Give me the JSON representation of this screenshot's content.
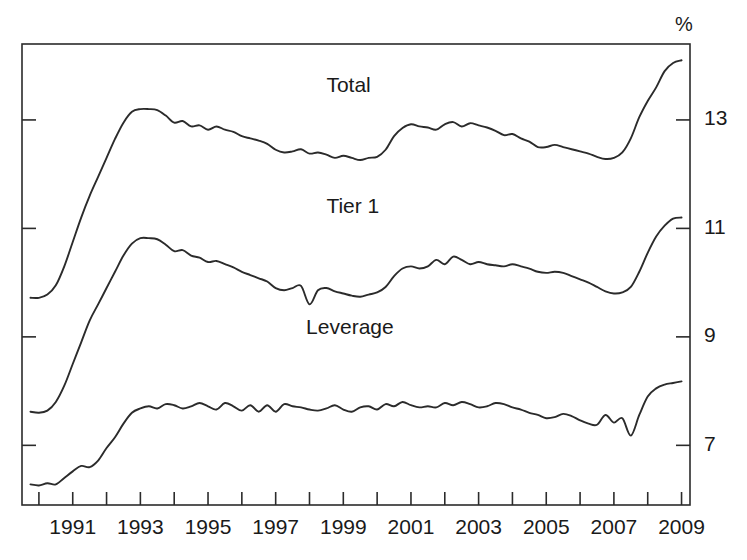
{
  "chart_data": {
    "type": "line",
    "title": "",
    "subtitle": "",
    "xlabel": "",
    "ylabel": "",
    "unit_label": "%",
    "grid": false,
    "legend_position": "inline-labels",
    "xlim": [
      1990.0,
      2009.75
    ],
    "ylim": [
      5.9,
      14.4
    ],
    "x_tick_years": [
      1990,
      1991,
      1992,
      1993,
      1994,
      1995,
      1996,
      1997,
      1998,
      1999,
      2000,
      2001,
      2002,
      2003,
      2004,
      2005,
      2006,
      2007,
      2008,
      2009
    ],
    "x_tick_labels": [
      "",
      "1991",
      "",
      "1993",
      "",
      "1995",
      "",
      "1997",
      "",
      "1999",
      "",
      "2001",
      "",
      "2003",
      "",
      "2005",
      "",
      "2007",
      "",
      "2009"
    ],
    "x_labeled_years": [
      1991,
      1993,
      1995,
      1997,
      1999,
      2001,
      2003,
      2005,
      2007,
      2009
    ],
    "y_ticks": [
      7,
      9,
      11,
      13
    ],
    "y_tick_labels": [
      "7",
      "9",
      "11",
      "13"
    ],
    "y_axis_side": "right",
    "series": [
      {
        "name": "Total",
        "label": "Total",
        "color": "#2b2b2b",
        "label_x": 1999.0,
        "label_y": 13.62,
        "x": [
          1990.25,
          1990.5,
          1990.75,
          1991.0,
          1991.25,
          1991.5,
          1991.75,
          1992.0,
          1992.25,
          1992.5,
          1992.75,
          1993.0,
          1993.25,
          1993.5,
          1993.75,
          1994.0,
          1994.25,
          1994.5,
          1994.75,
          1995.0,
          1995.25,
          1995.5,
          1995.75,
          1996.0,
          1996.25,
          1996.5,
          1996.75,
          1997.0,
          1997.25,
          1997.5,
          1997.75,
          1998.0,
          1998.25,
          1998.5,
          1998.75,
          1999.0,
          1999.25,
          1999.5,
          1999.75,
          2000.0,
          2000.25,
          2000.5,
          2000.75,
          2001.0,
          2001.25,
          2001.5,
          2001.75,
          2002.0,
          2002.25,
          2002.5,
          2002.75,
          2003.0,
          2003.25,
          2003.5,
          2003.75,
          2004.0,
          2004.25,
          2004.5,
          2004.75,
          2005.0,
          2005.25,
          2005.5,
          2005.75,
          2006.0,
          2006.25,
          2006.5,
          2006.75,
          2007.0,
          2007.25,
          2007.5,
          2007.75,
          2008.0,
          2008.25,
          2008.5,
          2008.75,
          2009.0,
          2009.25,
          2009.5
        ],
        "y": [
          9.72,
          9.72,
          9.78,
          9.95,
          10.3,
          10.75,
          11.2,
          11.6,
          11.95,
          12.3,
          12.65,
          12.95,
          13.15,
          13.2,
          13.2,
          13.18,
          13.08,
          12.95,
          12.98,
          12.88,
          12.9,
          12.82,
          12.88,
          12.82,
          12.78,
          12.7,
          12.66,
          12.62,
          12.56,
          12.45,
          12.4,
          12.42,
          12.46,
          12.38,
          12.4,
          12.36,
          12.3,
          12.34,
          12.3,
          12.26,
          12.3,
          12.32,
          12.45,
          12.7,
          12.85,
          12.92,
          12.88,
          12.86,
          12.82,
          12.92,
          12.96,
          12.88,
          12.94,
          12.9,
          12.86,
          12.8,
          12.72,
          12.74,
          12.66,
          12.6,
          12.5,
          12.5,
          12.54,
          12.5,
          12.46,
          12.42,
          12.38,
          12.32,
          12.28,
          12.3,
          12.4,
          12.66,
          13.05,
          13.35,
          13.6,
          13.9,
          14.05,
          14.1
        ]
      },
      {
        "name": "Tier 1",
        "label": "Tier 1",
        "color": "#2b2b2b",
        "label_x": 1999.0,
        "label_y": 11.38,
        "x": [
          1990.25,
          1990.5,
          1990.75,
          1991.0,
          1991.25,
          1991.5,
          1991.75,
          1992.0,
          1992.25,
          1992.5,
          1992.75,
          1993.0,
          1993.25,
          1993.5,
          1993.75,
          1994.0,
          1994.25,
          1994.5,
          1994.75,
          1995.0,
          1995.25,
          1995.5,
          1995.75,
          1996.0,
          1996.25,
          1996.5,
          1996.75,
          1997.0,
          1997.25,
          1997.5,
          1997.75,
          1998.0,
          1998.25,
          1998.5,
          1998.75,
          1999.0,
          1999.25,
          1999.5,
          1999.75,
          2000.0,
          2000.25,
          2000.5,
          2000.75,
          2001.0,
          2001.25,
          2001.5,
          2001.75,
          2002.0,
          2002.25,
          2002.5,
          2002.75,
          2003.0,
          2003.25,
          2003.5,
          2003.75,
          2004.0,
          2004.25,
          2004.5,
          2004.75,
          2005.0,
          2005.25,
          2005.5,
          2005.75,
          2006.0,
          2006.25,
          2006.5,
          2006.75,
          2007.0,
          2007.25,
          2007.5,
          2007.75,
          2008.0,
          2008.25,
          2008.5,
          2008.75,
          2009.0,
          2009.25,
          2009.5
        ],
        "y": [
          7.62,
          7.6,
          7.64,
          7.8,
          8.1,
          8.5,
          8.9,
          9.3,
          9.6,
          9.9,
          10.2,
          10.5,
          10.72,
          10.82,
          10.82,
          10.8,
          10.7,
          10.58,
          10.6,
          10.5,
          10.46,
          10.38,
          10.4,
          10.34,
          10.28,
          10.2,
          10.14,
          10.08,
          10.02,
          9.9,
          9.86,
          9.9,
          9.94,
          9.6,
          9.86,
          9.9,
          9.84,
          9.8,
          9.76,
          9.74,
          9.78,
          9.82,
          9.92,
          10.12,
          10.26,
          10.3,
          10.26,
          10.3,
          10.42,
          10.34,
          10.48,
          10.42,
          10.34,
          10.38,
          10.34,
          10.32,
          10.3,
          10.34,
          10.3,
          10.26,
          10.2,
          10.18,
          10.2,
          10.18,
          10.12,
          10.06,
          10.0,
          9.92,
          9.84,
          9.8,
          9.82,
          9.92,
          10.2,
          10.55,
          10.85,
          11.05,
          11.18,
          11.2
        ]
      },
      {
        "name": "Leverage",
        "label": "Leverage",
        "color": "#2b2b2b",
        "label_x": 1998.4,
        "label_y": 9.15,
        "x": [
          1990.25,
          1990.5,
          1990.75,
          1991.0,
          1991.25,
          1991.5,
          1991.75,
          1992.0,
          1992.25,
          1992.5,
          1992.75,
          1993.0,
          1993.25,
          1993.5,
          1993.75,
          1994.0,
          1994.25,
          1994.5,
          1994.75,
          1995.0,
          1995.25,
          1995.5,
          1995.75,
          1996.0,
          1996.25,
          1996.5,
          1996.75,
          1997.0,
          1997.25,
          1997.5,
          1997.75,
          1998.0,
          1998.25,
          1998.5,
          1998.75,
          1999.0,
          1999.25,
          1999.5,
          1999.75,
          2000.0,
          2000.25,
          2000.5,
          2000.75,
          2001.0,
          2001.25,
          2001.5,
          2001.75,
          2002.0,
          2002.25,
          2002.5,
          2002.75,
          2003.0,
          2003.25,
          2003.5,
          2003.75,
          2004.0,
          2004.25,
          2004.5,
          2004.75,
          2005.0,
          2005.25,
          2005.5,
          2005.75,
          2006.0,
          2006.25,
          2006.5,
          2006.75,
          2007.0,
          2007.25,
          2007.5,
          2007.75,
          2008.0,
          2008.25,
          2008.5,
          2008.75,
          2009.0,
          2009.25,
          2009.5
        ],
        "y": [
          6.28,
          6.26,
          6.3,
          6.28,
          6.4,
          6.52,
          6.62,
          6.6,
          6.72,
          6.95,
          7.15,
          7.4,
          7.6,
          7.68,
          7.72,
          7.68,
          7.76,
          7.74,
          7.68,
          7.72,
          7.78,
          7.72,
          7.66,
          7.78,
          7.72,
          7.64,
          7.74,
          7.62,
          7.74,
          7.62,
          7.76,
          7.72,
          7.7,
          7.66,
          7.64,
          7.68,
          7.74,
          7.66,
          7.62,
          7.7,
          7.72,
          7.66,
          7.76,
          7.72,
          7.8,
          7.74,
          7.7,
          7.72,
          7.7,
          7.78,
          7.74,
          7.8,
          7.76,
          7.7,
          7.72,
          7.78,
          7.76,
          7.7,
          7.66,
          7.6,
          7.56,
          7.5,
          7.52,
          7.58,
          7.54,
          7.46,
          7.4,
          7.38,
          7.56,
          7.42,
          7.5,
          7.18,
          7.56,
          7.9,
          8.05,
          8.12,
          8.15,
          8.18
        ]
      }
    ]
  },
  "geometry": {
    "plot_left": 22,
    "plot_right": 690,
    "plot_top": 44,
    "plot_bottom": 505,
    "unit_label_x": 684,
    "unit_label_y": 26
  }
}
